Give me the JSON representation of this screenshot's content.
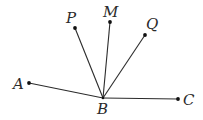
{
  "diagram": {
    "type": "angle-rays",
    "vertex": "B",
    "points": [
      {
        "id": "A",
        "label": "A"
      },
      {
        "id": "B",
        "label": "B"
      },
      {
        "id": "C",
        "label": "C"
      },
      {
        "id": "P",
        "label": "P"
      },
      {
        "id": "M",
        "label": "M"
      },
      {
        "id": "Q",
        "label": "Q"
      }
    ],
    "segments": [
      {
        "from": "B",
        "to": "A"
      },
      {
        "from": "B",
        "to": "C"
      },
      {
        "from": "B",
        "to": "P"
      },
      {
        "from": "B",
        "to": "M"
      },
      {
        "from": "B",
        "to": "Q"
      }
    ],
    "colors": {
      "stroke": "#2b2b2b",
      "point": "#111111",
      "background": "#ffffff"
    }
  }
}
